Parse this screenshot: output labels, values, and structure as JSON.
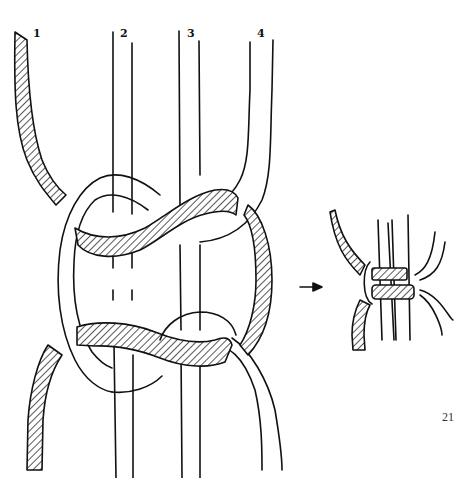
{
  "figure": {
    "cord_labels": [
      "1",
      "2",
      "3",
      "4"
    ],
    "page_number": "21",
    "arrow_symbol": "→",
    "colors": {
      "line": "#111111",
      "background": "#ffffff",
      "hatch": "#111111"
    },
    "panels": [
      {
        "name": "loose-knot",
        "description": "Expanded view of working cords 1 and 4 tied around filler cords 2 and 3"
      },
      {
        "name": "tightened-knot",
        "description": "Finished knot pulled tight"
      }
    ]
  }
}
